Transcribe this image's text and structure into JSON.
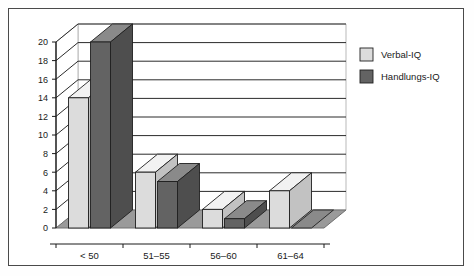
{
  "chart_data": {
    "type": "bar",
    "title": "",
    "xlabel": "",
    "ylabel": "",
    "categories": [
      "< 50",
      "51–55",
      "56–60",
      "61–64"
    ],
    "series": [
      {
        "name": "Verbal-IQ",
        "values": [
          14,
          6,
          2,
          4
        ],
        "color": "#dcdcdc"
      },
      {
        "name": "Handlungs-IQ",
        "values": [
          20,
          5,
          1,
          0
        ],
        "color": "#636363"
      }
    ],
    "ylim": [
      0,
      20
    ],
    "yticks": [
      0,
      2,
      4,
      6,
      8,
      10,
      12,
      14,
      16,
      18,
      20
    ],
    "ytick_labels": [
      "0",
      "2",
      "4",
      "6",
      "8",
      "10",
      "12",
      "14",
      "16",
      "18",
      "20"
    ],
    "grid": true,
    "grid_axis": "y",
    "legend_position": "right",
    "style": "3d-bar"
  },
  "legend": {
    "entries": [
      {
        "label": "Verbal-IQ",
        "swatch": "#dcdcdc"
      },
      {
        "label": "Handlungs-IQ",
        "swatch": "#636363"
      }
    ]
  },
  "colors": {
    "frame_border": "#4a4a4a",
    "background": "#ffffff",
    "floor": "#9a9a9a",
    "floor_edge": "#707070",
    "gridline": "#2b2b2b",
    "wall": "#ffffff",
    "wall_edge": "#b9b9b9",
    "axis": "#1a1a1a",
    "bar_light_face": "#dcdcdc",
    "bar_light_top": "#f2f2f2",
    "bar_light_side": "#c2c2c2",
    "bar_dark_face": "#636363",
    "bar_dark_top": "#8a8a8a",
    "bar_dark_side": "#4e4e4e",
    "bar_outline": "#1f1f1f"
  }
}
